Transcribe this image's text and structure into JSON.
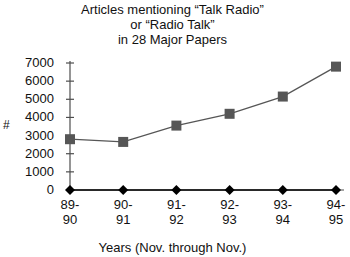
{
  "chart_data": {
    "type": "line",
    "title": "Articles mentioning “Talk Radio” or “Radio Talk” in 28 Major Papers",
    "title_lines": [
      "Articles mentioning “Talk Radio”",
      "or “Radio Talk”",
      "in 28 Major Papers"
    ],
    "xlabel": "Years (Nov. through Nov.)",
    "ylabel": "#",
    "categories": [
      "89-90",
      "90-91",
      "91-92",
      "92-93",
      "93-94",
      "94-95"
    ],
    "category_lines": [
      [
        "89-",
        "90"
      ],
      [
        "90-",
        "91"
      ],
      [
        "91-",
        "92"
      ],
      [
        "92-",
        "93"
      ],
      [
        "93-",
        "94"
      ],
      [
        "94-",
        "95"
      ]
    ],
    "ylim": [
      0,
      7000
    ],
    "yticks": [
      7000,
      6000,
      5000,
      4000,
      3000,
      2000,
      1000,
      0
    ],
    "ytick_labels": [
      "7000",
      "6000",
      "5000",
      "4000",
      "3000",
      "2000",
      "1000",
      "0"
    ],
    "grid": false,
    "legend": "none",
    "series": [
      {
        "name": "articles",
        "marker": "square",
        "color": "#565656",
        "values": [
          2800,
          2650,
          3550,
          4200,
          5150,
          6800
        ]
      },
      {
        "name": "baseline",
        "marker": "diamond",
        "color": "#000000",
        "values": [
          0,
          0,
          0,
          0,
          0,
          0
        ]
      }
    ]
  },
  "colors": {
    "square_series": "#565656",
    "diamond_series": "#000000",
    "axis": "#4d4d4d",
    "text": "#111111",
    "background": "#ffffff"
  }
}
